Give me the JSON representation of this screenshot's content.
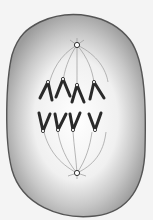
{
  "diagram": {
    "colors": {
      "background": "#f4f4f4",
      "membrane": "#555555",
      "cytoplasm_outer": "#a8a8a8",
      "cytoplasm_inner": "#efefef",
      "chromosome": "#2a2a2a",
      "spindle": "#888888"
    },
    "elements": {
      "centrosomes": [
        "top",
        "bottom"
      ],
      "chromosome_sets": {
        "upper": 4,
        "lower": 4
      }
    }
  }
}
